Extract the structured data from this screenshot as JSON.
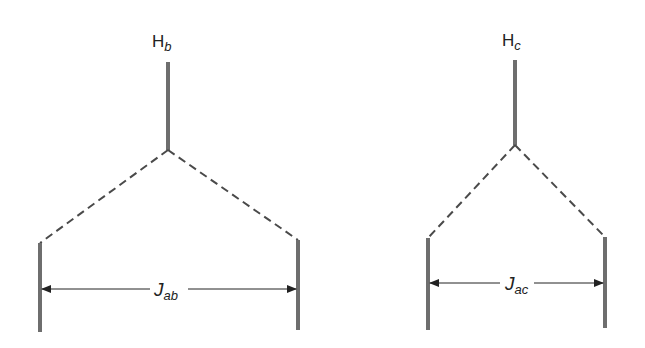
{
  "diagram": {
    "type": "nmr-splitting-tree",
    "colors": {
      "line": "#6e6e6e",
      "dash": "#4a4a4a",
      "arrow": "#222222",
      "text": "#222222"
    },
    "trees": [
      {
        "id": "Hb",
        "label_main": "H",
        "label_sub": "b",
        "coupling_main": "J",
        "coupling_sub": "ab",
        "parent_line": {
          "x": 168,
          "y1": 62,
          "y2": 150
        },
        "left_line": {
          "x": 40,
          "y1": 243,
          "y2": 332
        },
        "right_line": {
          "x": 298,
          "y1": 240,
          "y2": 330
        },
        "arrow_y": 289
      },
      {
        "id": "Hc",
        "label_main": "H",
        "label_sub": "c",
        "coupling_main": "J",
        "coupling_sub": "ac",
        "parent_line": {
          "x": 515,
          "y1": 60,
          "y2": 145
        },
        "left_line": {
          "x": 428,
          "y1": 238,
          "y2": 330
        },
        "right_line": {
          "x": 605,
          "y1": 237,
          "y2": 328
        },
        "arrow_y": 283
      }
    ]
  }
}
